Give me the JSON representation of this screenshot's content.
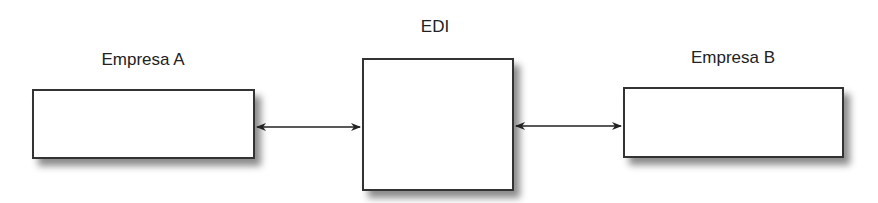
{
  "diagram": {
    "nodes": [
      {
        "id": "empresa-a",
        "label": "Empresa A"
      },
      {
        "id": "edi",
        "label": "EDI"
      },
      {
        "id": "empresa-b",
        "label": "Empresa B"
      }
    ],
    "edges": [
      {
        "from": "empresa-a",
        "to": "edi",
        "type": "bidirectional"
      },
      {
        "from": "edi",
        "to": "empresa-b",
        "type": "bidirectional"
      }
    ],
    "colors": {
      "border": "#333333",
      "background": "#ffffff",
      "text": "#222222"
    }
  }
}
